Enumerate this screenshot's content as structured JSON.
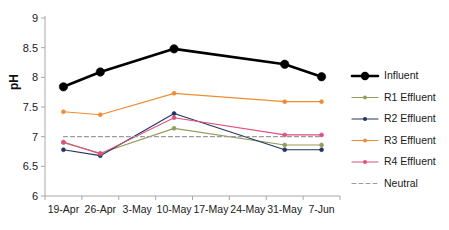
{
  "chart_data": {
    "type": "line",
    "title": "",
    "xlabel": "",
    "ylabel": "pH",
    "categories": [
      "19-Apr",
      "26-Apr",
      "3-May",
      "10-May",
      "17-May",
      "24-May",
      "31-May",
      "7-Jun"
    ],
    "ylim": [
      6,
      9
    ],
    "ytick_labels": [
      "6",
      "6.5",
      "7",
      "7.5",
      "8",
      "8.5",
      "9"
    ],
    "ytick_values": [
      6,
      6.5,
      7,
      7.5,
      8,
      8.5,
      9
    ],
    "grid": false,
    "legend_position": "right",
    "marker_categories": [
      "19-Apr",
      "26-Apr",
      "10-May",
      "31-May",
      "7-Jun"
    ],
    "series": [
      {
        "name": "Influent",
        "color": "#000000",
        "x": [
          "19-Apr",
          "26-Apr",
          "10-May",
          "31-May",
          "7-Jun"
        ],
        "values": [
          7.84,
          8.09,
          8.48,
          8.22,
          8.01
        ],
        "line_width": 2.6,
        "marker_size": 4.2,
        "dashed": false
      },
      {
        "name": "R1 Effluent",
        "color": "#949b5b",
        "x": [
          "19-Apr",
          "26-Apr",
          "10-May",
          "31-May",
          "7-Jun"
        ],
        "values": [
          6.9,
          6.72,
          7.14,
          6.86,
          6.86
        ],
        "line_width": 1.1,
        "marker_size": 2.0,
        "dashed": false
      },
      {
        "name": "R2 Effluent",
        "color": "#22355f",
        "x": [
          "19-Apr",
          "26-Apr",
          "10-May",
          "31-May",
          "7-Jun"
        ],
        "values": [
          6.78,
          6.68,
          7.39,
          6.78,
          6.78
        ],
        "line_width": 1.1,
        "marker_size": 2.0,
        "dashed": false
      },
      {
        "name": "R3 Effluent",
        "color": "#ef8c33",
        "x": [
          "19-Apr",
          "26-Apr",
          "10-May",
          "31-May",
          "7-Jun"
        ],
        "values": [
          7.42,
          7.37,
          7.73,
          7.59,
          7.59
        ],
        "line_width": 1.1,
        "marker_size": 2.0,
        "dashed": false
      },
      {
        "name": "R4 Effluent",
        "color": "#e0507f",
        "x": [
          "19-Apr",
          "26-Apr",
          "10-May",
          "31-May",
          "7-Jun"
        ],
        "values": [
          6.91,
          6.71,
          7.32,
          7.03,
          7.03
        ],
        "line_width": 1.1,
        "marker_size": 2.0,
        "dashed": false
      },
      {
        "name": "Neutral",
        "color": "#9a9a9a",
        "x": [
          "19-Apr",
          "7-Jun"
        ],
        "values": [
          7.0,
          7.0
        ],
        "line_width": 1.1,
        "marker_size": 0,
        "dashed": true
      }
    ]
  },
  "legend": {
    "items": [
      {
        "label": "Influent"
      },
      {
        "label": "R1 Effluent"
      },
      {
        "label": "R2 Effluent"
      },
      {
        "label": "R3 Effluent"
      },
      {
        "label": "R4 Effluent"
      },
      {
        "label": "Neutral"
      }
    ]
  }
}
